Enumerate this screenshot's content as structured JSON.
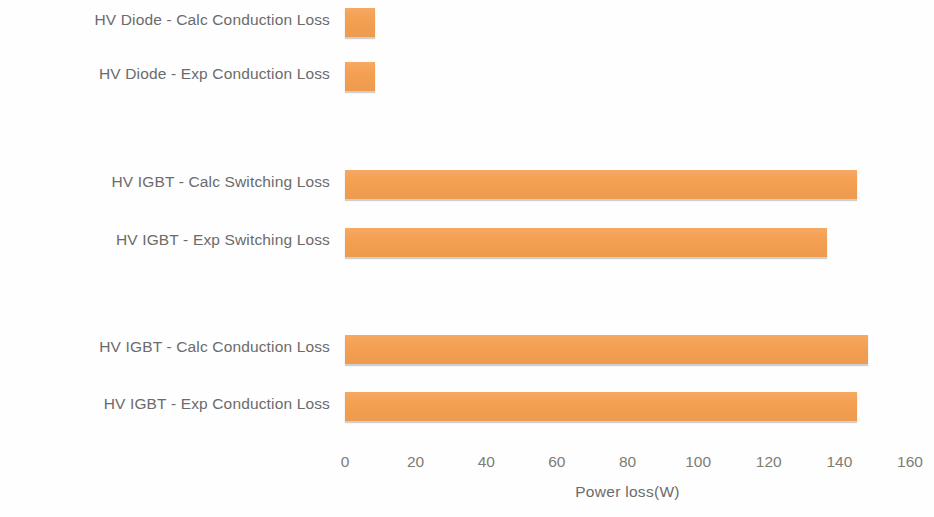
{
  "chart_data": {
    "type": "bar",
    "orientation": "horizontal",
    "title": "",
    "xlabel": "Power loss(W)",
    "ylabel": "",
    "xlim": [
      0,
      160
    ],
    "xticks": [
      0,
      20,
      40,
      60,
      80,
      100,
      120,
      140,
      160
    ],
    "xtick_labels": [
      "0",
      "20",
      "40",
      "60",
      "80",
      "100",
      "120",
      "140",
      "160"
    ],
    "grid": false,
    "legend": "none",
    "bar_color": "#f5a052",
    "categories": [
      "HV Diode - Calc Conduction Loss",
      "HV Diode - Exp Conduction Loss",
      "HV IGBT - Calc Switching Loss",
      "HV IGBT - Exp Switching Loss",
      "HV IGBT - Calc Conduction Loss",
      "HV IGBT - Exp Conduction Loss"
    ],
    "values": [
      8.5,
      8.5,
      145,
      136.5,
      148,
      145
    ],
    "bars": [
      {
        "label": "HV Diode - Calc Conduction Loss",
        "value": 8.5,
        "top": 8,
        "height": 29
      },
      {
        "label": "HV Diode - Exp Conduction Loss",
        "value": 8.5,
        "top": 62,
        "height": 29
      },
      {
        "label": "HV IGBT - Calc Switching Loss",
        "value": 145,
        "top": 170,
        "height": 29
      },
      {
        "label": "HV IGBT - Exp Switching Loss",
        "value": 136.5,
        "top": 228,
        "height": 29
      },
      {
        "label": "HV IGBT - Calc Conduction Loss",
        "value": 148,
        "top": 335,
        "height": 29
      },
      {
        "label": "HV IGBT - Exp Conduction Loss",
        "value": 145,
        "top": 392,
        "height": 29
      }
    ]
  },
  "axis": {
    "title": "Power loss(W)",
    "ticks": [
      "0",
      "20",
      "40",
      "60",
      "80",
      "100",
      "120",
      "140",
      "160"
    ]
  },
  "labels": {
    "row0": "HV Diode - Calc Conduction Loss",
    "row1": "HV Diode - Exp Conduction Loss",
    "row2": "HV IGBT - Calc Switching Loss",
    "row3": "HV IGBT - Exp Switching Loss",
    "row4": "HV IGBT - Calc Conduction Loss",
    "row5": "HV IGBT - Exp Conduction Loss"
  }
}
